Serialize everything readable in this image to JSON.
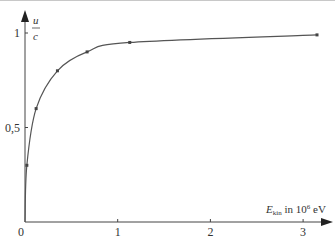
{
  "chart_data": {
    "type": "line",
    "title": "",
    "xlabel": "E_kin in 10^6 eV",
    "xlabel_main": "E",
    "xlabel_sub": "kin",
    "xlabel_rest": " in 10",
    "xlabel_exp": "6",
    "xlabel_unit": " eV",
    "ylabel": "u/c",
    "ylabel_num": "u",
    "ylabel_den": "c",
    "xlim": [
      0,
      3.3
    ],
    "ylim": [
      0,
      1.05
    ],
    "x_ticks": [
      "0",
      "1",
      "2",
      "3"
    ],
    "y_ticks": [
      "0,5",
      "1"
    ],
    "grid": false,
    "series": [
      {
        "name": "u/c vs kinetic energy",
        "x": [
          0,
          0.02,
          0.12,
          0.35,
          0.67,
          1.13,
          3.15
        ],
        "y": [
          0,
          0.3,
          0.6,
          0.8,
          0.9,
          0.95,
          0.99
        ]
      }
    ]
  }
}
